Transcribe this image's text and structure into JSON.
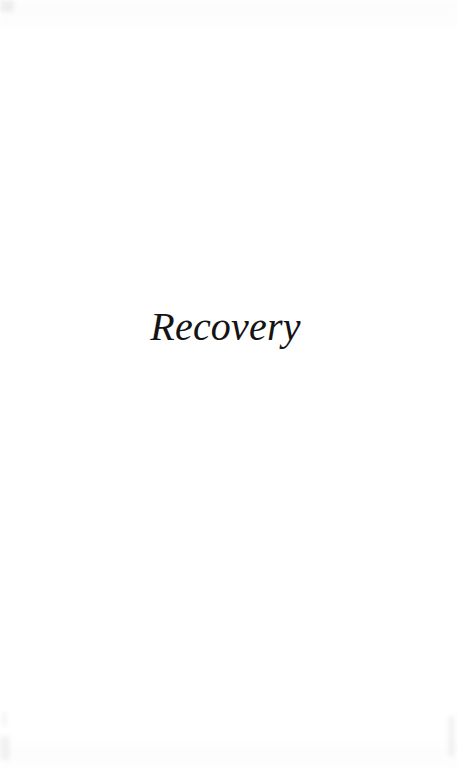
{
  "document": {
    "type": "book-part-title-page",
    "page_width": 458,
    "page_height": 768,
    "background_color": "#ffffff",
    "ink_color": "#141414"
  },
  "page": {
    "part_title": "Recovery",
    "running_head": "",
    "folio": "",
    "body_text": ""
  },
  "artifacts": {
    "top_left_smudge": "",
    "bottom_left_smudge": "",
    "bottom_left_streak": "",
    "bottom_right_streak": "",
    "top_tone_band": "",
    "bottom_tone_band": ""
  }
}
